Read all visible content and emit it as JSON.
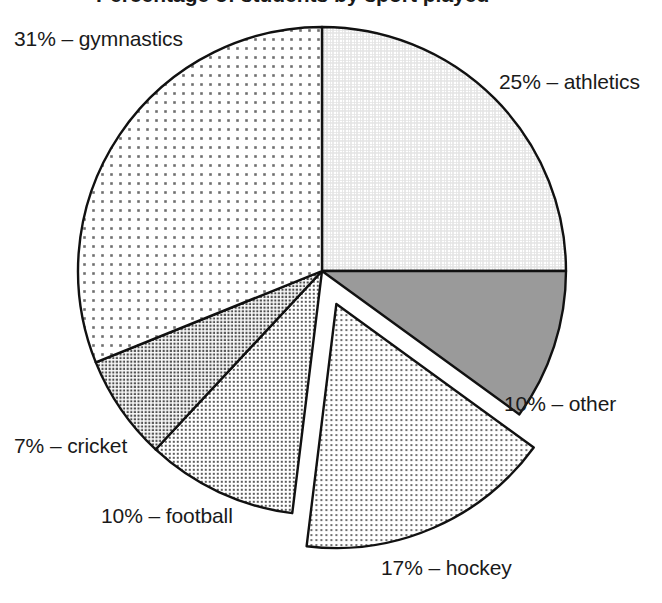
{
  "chart_data": {
    "type": "pie",
    "title": "Percentage of students by sport played",
    "title_clipped": true,
    "categories": [
      "athletics",
      "other",
      "hockey",
      "football",
      "cricket",
      "gymnastics"
    ],
    "values": [
      25,
      10,
      17,
      10,
      7,
      31
    ],
    "unit": "%",
    "labels": [
      "25% – athletics",
      "10% – other",
      "17% – hockey",
      "10% – football",
      "7% – cricket",
      "31% – gymnastics"
    ],
    "exploded_slice": "hockey",
    "start_angle_deg": 0,
    "direction": "clockwise",
    "legend": "none",
    "grid": false,
    "xlabel": "",
    "ylabel": "",
    "slices": [
      {
        "name": "athletics",
        "value": 25,
        "label": "25% – athletics",
        "start_deg": 0,
        "end_deg": 90,
        "fill": "light-crosshatch",
        "color": "#f2f2f2",
        "exploded": false
      },
      {
        "name": "other",
        "value": 10,
        "label": "10% – other",
        "start_deg": 90,
        "end_deg": 126,
        "fill": "solid-gray",
        "color": "#9a9a9a",
        "exploded": false
      },
      {
        "name": "hockey",
        "value": 17,
        "label": "17% – hockey",
        "start_deg": 126,
        "end_deg": 187,
        "fill": "dots-medium",
        "color": "#cccccc",
        "exploded": true
      },
      {
        "name": "football",
        "value": 10,
        "label": "10% – football",
        "start_deg": 187,
        "end_deg": 223,
        "fill": "dots-dark",
        "color": "#b4b4b4",
        "exploded": false
      },
      {
        "name": "cricket",
        "value": 7,
        "label": "7% – cricket",
        "start_deg": 223,
        "end_deg": 248,
        "fill": "dots-darker",
        "color": "#a6a6a6",
        "exploded": false
      },
      {
        "name": "gymnastics",
        "value": 31,
        "label": "31% – gymnastics",
        "start_deg": 248,
        "end_deg": 360,
        "fill": "dots-sparse",
        "color": "#e6e6e6",
        "exploded": false
      }
    ],
    "geometry": {
      "center_x": 322,
      "center_y": 271,
      "radius": 244,
      "explode_offset": 36
    },
    "outline_color": "#111111",
    "background_color": "#ffffff"
  }
}
